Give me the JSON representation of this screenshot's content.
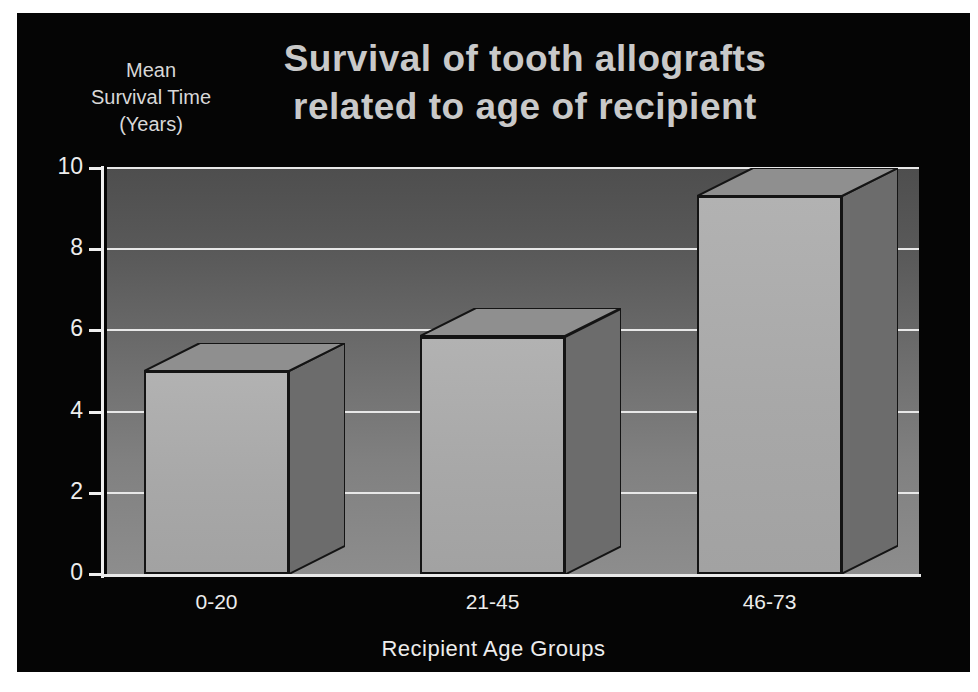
{
  "slide": {
    "background_color": "#050505",
    "title_color": "#c9c9c9",
    "text_color": "#ededed"
  },
  "title": {
    "line1": "Survival of tooth allografts",
    "line2": "related to age of recipient"
  },
  "y_axis_caption": {
    "line1": "Mean",
    "line2": "Survival Time",
    "line3": "(Years)"
  },
  "chart_data": {
    "type": "bar",
    "title": "Survival of tooth allografts related to age of recipient",
    "xlabel": "Recipient Age Groups",
    "ylabel": "Mean Survival Time (Years)",
    "categories": [
      "0-20",
      "21-45",
      "46-73"
    ],
    "values": [
      5.0,
      5.85,
      9.3
    ],
    "ylim": [
      0,
      10
    ],
    "yticks": [
      0,
      2,
      4,
      6,
      8,
      10
    ],
    "ytick_labels": [
      "0",
      "2",
      "4",
      "6",
      "8",
      "10"
    ],
    "grid": true,
    "grid_axis": "y",
    "legend": "none",
    "style": "3d-shaded-bars",
    "bar_face_color": "#a8a8a8",
    "bar_side_color": "#6c6c6c",
    "bar_top_color": "#8f8f8f",
    "plot_background": "vertical-gradient-dark-to-light-gray",
    "gridline_color": "#e8e8e8"
  }
}
